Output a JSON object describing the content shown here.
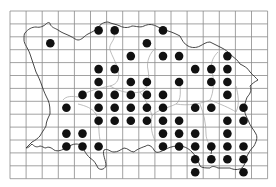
{
  "map": {
    "type": "distribution-grid-map",
    "background": "#ffffff",
    "grid": {
      "left": 10,
      "top": 11,
      "cell_width": 16.1,
      "cell_height": 12.9,
      "columns": 16,
      "rows": 13,
      "line_color": "#8a8a8a"
    },
    "coastline_color": "#333333",
    "parish_boundary_color": "#9a9a9a",
    "dot_color": "#111111",
    "dot_radius": 4.3,
    "occupied_cells": [
      [
        2,
        2
      ],
      [
        5,
        1
      ],
      [
        6,
        1
      ],
      [
        9,
        1
      ],
      [
        8,
        2
      ],
      [
        7,
        3
      ],
      [
        9,
        3
      ],
      [
        10,
        3
      ],
      [
        13,
        3
      ],
      [
        5,
        4
      ],
      [
        6,
        4
      ],
      [
        11,
        4
      ],
      [
        12,
        4
      ],
      [
        13,
        4
      ],
      [
        5,
        5
      ],
      [
        7,
        5
      ],
      [
        8,
        5
      ],
      [
        10,
        5
      ],
      [
        12,
        5
      ],
      [
        13,
        5
      ],
      [
        4,
        6
      ],
      [
        5,
        6
      ],
      [
        6,
        6
      ],
      [
        7,
        6
      ],
      [
        8,
        6
      ],
      [
        9,
        6
      ],
      [
        13,
        6
      ],
      [
        3,
        7
      ],
      [
        5,
        7
      ],
      [
        6,
        7
      ],
      [
        7,
        7
      ],
      [
        8,
        7
      ],
      [
        9,
        7
      ],
      [
        11,
        7
      ],
      [
        12,
        7
      ],
      [
        14,
        7
      ],
      [
        5,
        8
      ],
      [
        6,
        8
      ],
      [
        7,
        8
      ],
      [
        8,
        8
      ],
      [
        9,
        8
      ],
      [
        10,
        8
      ],
      [
        13,
        8
      ],
      [
        14,
        8
      ],
      [
        3,
        9
      ],
      [
        4,
        9
      ],
      [
        9,
        9
      ],
      [
        10,
        9
      ],
      [
        11,
        9
      ],
      [
        13,
        9
      ],
      [
        3,
        10
      ],
      [
        4,
        10
      ],
      [
        5,
        10
      ],
      [
        9,
        10
      ],
      [
        10,
        10
      ],
      [
        11,
        10
      ],
      [
        12,
        10
      ],
      [
        13,
        10
      ],
      [
        14,
        10
      ],
      [
        11,
        11
      ],
      [
        12,
        11
      ],
      [
        13,
        11
      ],
      [
        14,
        11
      ],
      [
        11,
        12
      ],
      [
        14,
        12
      ]
    ]
  },
  "caption": {
    "text": ""
  }
}
